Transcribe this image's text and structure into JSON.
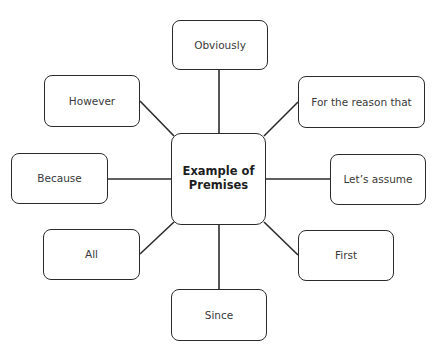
{
  "diagram": {
    "type": "mind-map",
    "center": {
      "line1": "Example of",
      "line2": "Premises",
      "box": {
        "x": 171,
        "y": 133,
        "w": 95,
        "h": 92
      }
    },
    "nodes": [
      {
        "id": "obviously",
        "label": "Obviously",
        "box": {
          "x": 172,
          "y": 20,
          "w": 96,
          "h": 50
        },
        "connector": {
          "x1": 219,
          "y1": 70,
          "x2": 219,
          "y2": 133
        }
      },
      {
        "id": "however",
        "label": "However",
        "box": {
          "x": 44,
          "y": 75,
          "w": 96,
          "h": 52
        },
        "connector": {
          "x1": 140,
          "y1": 101,
          "x2": 174,
          "y2": 136
        }
      },
      {
        "id": "for-the-reason-that",
        "label": "For the reason that",
        "box": {
          "x": 298,
          "y": 76,
          "w": 127,
          "h": 52
        },
        "connector": {
          "x1": 298,
          "y1": 102,
          "x2": 264,
          "y2": 136
        }
      },
      {
        "id": "because",
        "label": "Because",
        "box": {
          "x": 11,
          "y": 153,
          "w": 97,
          "h": 51
        },
        "connector": {
          "x1": 108,
          "y1": 179,
          "x2": 171,
          "y2": 179
        }
      },
      {
        "id": "lets-assume",
        "label": "Let’s assume",
        "box": {
          "x": 330,
          "y": 154,
          "w": 96,
          "h": 51
        },
        "connector": {
          "x1": 266,
          "y1": 179,
          "x2": 330,
          "y2": 179
        }
      },
      {
        "id": "all",
        "label": "All",
        "box": {
          "x": 43,
          "y": 229,
          "w": 97,
          "h": 51
        },
        "connector": {
          "x1": 140,
          "y1": 254,
          "x2": 174,
          "y2": 222
        }
      },
      {
        "id": "first",
        "label": "First",
        "box": {
          "x": 298,
          "y": 230,
          "w": 96,
          "h": 51
        },
        "connector": {
          "x1": 298,
          "y1": 255,
          "x2": 264,
          "y2": 222
        }
      },
      {
        "id": "since",
        "label": "Since",
        "box": {
          "x": 171,
          "y": 289,
          "w": 96,
          "h": 52
        },
        "connector": {
          "x1": 219,
          "y1": 225,
          "x2": 219,
          "y2": 289
        }
      }
    ],
    "colors": {
      "stroke": "#2b2b2b",
      "background": "#ffffff",
      "text": "#3a3a3a"
    }
  }
}
